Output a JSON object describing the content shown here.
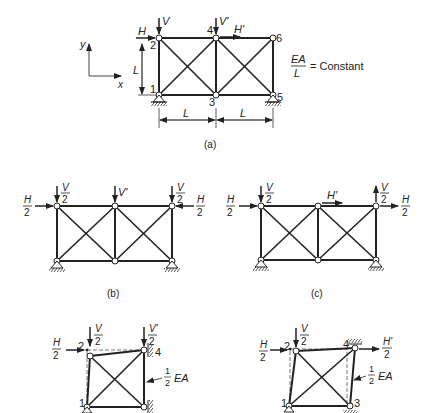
{
  "figure_a": {
    "caption": "(a)",
    "axis_x": "x",
    "axis_y": "y",
    "node_labels": [
      "1",
      "2",
      "3",
      "4",
      "5",
      "6"
    ],
    "loads": {
      "H": "H",
      "V": "V",
      "V_prime": "V'",
      "H_prime": "H'"
    },
    "dim_vertical": "L",
    "dim_horizontal_left": "L",
    "dim_horizontal_right": "L",
    "stiffness_num": "EA",
    "stiffness_den": "L",
    "stiffness_rest": "= Constant"
  },
  "figure_b": {
    "caption": "(b)",
    "loads": {
      "H_half_num": "H",
      "half_den": "2",
      "V_half_num": "V",
      "V_prime": "V'"
    }
  },
  "figure_c": {
    "caption": "(c)",
    "loads": {
      "H_half_num": "H",
      "half_den": "2",
      "V_half_num": "V",
      "H_prime": "H'"
    }
  },
  "figure_d": {
    "node_labels": [
      "1",
      "2",
      "3",
      "4"
    ],
    "loads": {
      "H_num": "H",
      "V_num": "V",
      "V_prime_num": "V'",
      "den": "2"
    },
    "member_label_num": "1",
    "member_label_den": "2",
    "member_label_rest": "EA"
  },
  "figure_e": {
    "node_labels": [
      "1",
      "2",
      "3",
      "4"
    ],
    "loads": {
      "H_num": "H",
      "V_num": "V",
      "H_prime_num": "H'",
      "den": "2"
    },
    "member_label_num": "1",
    "member_label_den": "2",
    "member_label_rest": "EA"
  }
}
